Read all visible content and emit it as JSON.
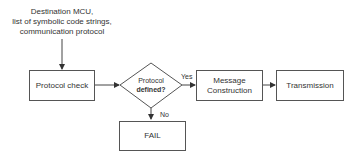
{
  "diagram": {
    "input_label": [
      "Destination MCU,",
      "list of symbolic code strings,",
      "communication protocol"
    ],
    "nodes": {
      "protocol_check": "Protocol check",
      "decision_line1": "Protocol",
      "decision_line2": "defined?",
      "message_line1": "Message",
      "message_line2": "Construction",
      "transmission": "Transmission",
      "fail": "FAIL"
    },
    "edges": {
      "yes": "Yes",
      "no": "No"
    }
  }
}
